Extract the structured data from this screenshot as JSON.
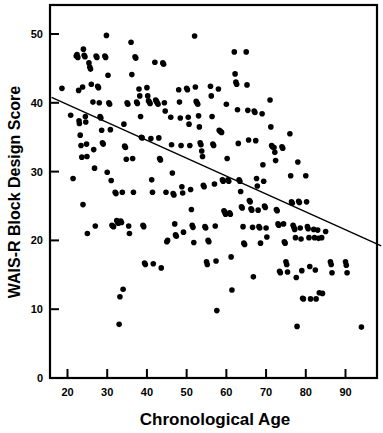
{
  "chart_data": {
    "type": "scatter",
    "title": "",
    "xlabel": "Chronological Age",
    "ylabel": "WAIS-R Block Design Score",
    "xlim": [
      16,
      99
    ],
    "ylim": [
      0,
      53
    ],
    "xticks": [
      20,
      30,
      40,
      50,
      60,
      70,
      80,
      90
    ],
    "yticks": [
      0,
      10,
      20,
      30,
      40,
      50
    ],
    "xtick_labels": [
      "20",
      "30",
      "40",
      "50",
      "60",
      "70",
      "80",
      "90"
    ],
    "ytick_labels": [
      "0",
      "10",
      "20",
      "30",
      "40",
      "50"
    ],
    "grid": false,
    "legend": null,
    "marker": {
      "shape": "circle",
      "color": "#000000",
      "size_px": 5.6
    },
    "trend_line": {
      "type": "linear-regression",
      "color": "#000000",
      "width_px": 1.4,
      "x_start": 16,
      "y_start": 40.8,
      "x_end": 99,
      "y_end": 19.2
    },
    "frame": {
      "top": true,
      "right": true,
      "bottom": true,
      "left": true,
      "color": "#000000"
    },
    "n_points": 284,
    "points": [
      [
        18.6,
        42.1
      ],
      [
        20.8,
        38.2
      ],
      [
        21.4,
        29.0
      ],
      [
        22.2,
        46.8
      ],
      [
        22.4,
        47.0
      ],
      [
        22.6,
        46.6
      ],
      [
        22.8,
        41.8
      ],
      [
        22.9,
        37.4
      ],
      [
        23.0,
        37.0
      ],
      [
        23.2,
        35.3
      ],
      [
        23.4,
        33.8
      ],
      [
        23.6,
        32.1
      ],
      [
        23.8,
        42.3
      ],
      [
        23.9,
        25.2
      ],
      [
        24.0,
        47.8
      ],
      [
        24.2,
        46.9
      ],
      [
        24.4,
        46.7
      ],
      [
        24.5,
        38.0
      ],
      [
        24.6,
        37.2
      ],
      [
        24.8,
        34.0
      ],
      [
        24.9,
        32.2
      ],
      [
        25.0,
        21.0
      ],
      [
        25.4,
        45.8
      ],
      [
        25.6,
        45.2
      ],
      [
        25.8,
        44.9
      ],
      [
        26.0,
        42.7
      ],
      [
        26.4,
        40.1
      ],
      [
        26.6,
        33.2
      ],
      [
        26.8,
        30.5
      ],
      [
        27.0,
        22.1
      ],
      [
        27.2,
        46.8
      ],
      [
        27.4,
        46.6
      ],
      [
        27.6,
        42.4
      ],
      [
        27.8,
        42.2
      ],
      [
        28.0,
        40.0
      ],
      [
        28.2,
        38.0
      ],
      [
        28.4,
        37.8
      ],
      [
        28.6,
        36.0
      ],
      [
        28.8,
        34.2
      ],
      [
        29.0,
        34.0
      ],
      [
        29.4,
        46.8
      ],
      [
        29.6,
        46.6
      ],
      [
        29.8,
        49.8
      ],
      [
        30.0,
        29.9
      ],
      [
        30.2,
        44.0
      ],
      [
        30.4,
        40.0
      ],
      [
        30.6,
        39.8
      ],
      [
        30.8,
        36.1
      ],
      [
        31.0,
        28.7
      ],
      [
        31.2,
        22.2
      ],
      [
        31.4,
        22.1
      ],
      [
        31.6,
        22.0
      ],
      [
        32.0,
        27.0
      ],
      [
        32.2,
        26.8
      ],
      [
        32.4,
        22.9
      ],
      [
        32.6,
        22.7
      ],
      [
        32.8,
        22.5
      ],
      [
        33.0,
        7.8
      ],
      [
        33.2,
        11.8
      ],
      [
        33.4,
        22.8
      ],
      [
        33.6,
        22.6
      ],
      [
        33.8,
        27.0
      ],
      [
        34.0,
        12.9
      ],
      [
        34.2,
        36.9
      ],
      [
        34.4,
        33.7
      ],
      [
        34.6,
        33.5
      ],
      [
        34.8,
        31.8
      ],
      [
        35.0,
        40.0
      ],
      [
        35.2,
        39.8
      ],
      [
        35.4,
        22.1
      ],
      [
        35.6,
        21.0
      ],
      [
        36.0,
        48.8
      ],
      [
        36.2,
        44.1
      ],
      [
        36.4,
        31.9
      ],
      [
        36.6,
        27.0
      ],
      [
        37.0,
        46.7
      ],
      [
        37.2,
        46.5
      ],
      [
        37.4,
        40.1
      ],
      [
        37.6,
        39.9
      ],
      [
        38.0,
        42.0
      ],
      [
        38.2,
        41.0
      ],
      [
        38.4,
        38.0
      ],
      [
        38.6,
        35.0
      ],
      [
        38.8,
        34.9
      ],
      [
        39.0,
        22.2
      ],
      [
        39.2,
        22.0
      ],
      [
        39.4,
        16.7
      ],
      [
        39.6,
        16.5
      ],
      [
        40.0,
        42.2
      ],
      [
        40.2,
        41.0
      ],
      [
        40.4,
        40.3
      ],
      [
        40.6,
        40.1
      ],
      [
        40.8,
        39.9
      ],
      [
        41.0,
        34.8
      ],
      [
        41.2,
        28.8
      ],
      [
        41.4,
        27.0
      ],
      [
        41.6,
        16.6
      ],
      [
        42.0,
        45.9
      ],
      [
        42.2,
        40.4
      ],
      [
        42.4,
        40.2
      ],
      [
        42.6,
        40.0
      ],
      [
        42.8,
        39.8
      ],
      [
        43.0,
        34.9
      ],
      [
        43.2,
        31.9
      ],
      [
        43.4,
        31.7
      ],
      [
        43.6,
        16.0
      ],
      [
        44.0,
        45.8
      ],
      [
        44.2,
        45.6
      ],
      [
        44.4,
        40.0
      ],
      [
        44.6,
        38.8
      ],
      [
        44.8,
        27.0
      ],
      [
        45.0,
        19.8
      ],
      [
        45.2,
        20.0
      ],
      [
        46.0,
        37.9
      ],
      [
        46.2,
        33.9
      ],
      [
        46.4,
        29.8
      ],
      [
        46.6,
        26.8
      ],
      [
        46.8,
        26.6
      ],
      [
        47.0,
        22.4
      ],
      [
        47.2,
        20.8
      ],
      [
        47.4,
        20.6
      ],
      [
        48.0,
        41.9
      ],
      [
        48.2,
        40.1
      ],
      [
        48.4,
        37.8
      ],
      [
        48.6,
        33.8
      ],
      [
        48.8,
        27.8
      ],
      [
        49.0,
        26.9
      ],
      [
        49.2,
        21.2
      ],
      [
        50.0,
        42.1
      ],
      [
        50.2,
        41.9
      ],
      [
        50.4,
        37.9
      ],
      [
        50.6,
        36.9
      ],
      [
        50.8,
        33.8
      ],
      [
        51.0,
        27.4
      ],
      [
        51.2,
        24.5
      ],
      [
        51.4,
        22.2
      ],
      [
        51.6,
        21.9
      ],
      [
        51.8,
        19.7
      ],
      [
        52.0,
        49.7
      ],
      [
        52.2,
        42.3
      ],
      [
        52.4,
        40.2
      ],
      [
        52.6,
        40.0
      ],
      [
        52.8,
        39.8
      ],
      [
        53.0,
        38.1
      ],
      [
        53.2,
        36.5
      ],
      [
        53.4,
        34.2
      ],
      [
        53.6,
        33.9
      ],
      [
        53.8,
        33.0
      ],
      [
        54.0,
        32.2
      ],
      [
        54.2,
        28.0
      ],
      [
        54.4,
        27.8
      ],
      [
        54.6,
        22.0
      ],
      [
        54.8,
        21.8
      ],
      [
        55.0,
        16.9
      ],
      [
        55.2,
        16.5
      ],
      [
        55.4,
        20.0
      ],
      [
        55.6,
        19.8
      ],
      [
        56.0,
        42.4
      ],
      [
        56.2,
        41.0
      ],
      [
        56.4,
        38.0
      ],
      [
        56.6,
        34.0
      ],
      [
        56.8,
        33.8
      ],
      [
        57.0,
        28.2
      ],
      [
        57.2,
        22.1
      ],
      [
        57.4,
        17.0
      ],
      [
        57.6,
        9.8
      ],
      [
        58.0,
        42.0
      ],
      [
        58.2,
        36.0
      ],
      [
        58.4,
        35.9
      ],
      [
        58.6,
        35.8
      ],
      [
        58.8,
        35.7
      ],
      [
        59.0,
        28.8
      ],
      [
        59.2,
        28.6
      ],
      [
        59.4,
        24.3
      ],
      [
        59.6,
        24.1
      ],
      [
        59.8,
        23.8
      ],
      [
        60.0,
        39.8
      ],
      [
        60.2,
        31.9
      ],
      [
        60.4,
        28.8
      ],
      [
        60.6,
        28.6
      ],
      [
        60.8,
        24.0
      ],
      [
        61.0,
        23.8
      ],
      [
        61.2,
        17.6
      ],
      [
        61.4,
        12.8
      ],
      [
        62.0,
        47.4
      ],
      [
        62.2,
        44.2
      ],
      [
        62.4,
        43.0
      ],
      [
        62.6,
        42.7
      ],
      [
        62.8,
        39.0
      ],
      [
        63.0,
        34.1
      ],
      [
        63.2,
        28.8
      ],
      [
        63.4,
        28.6
      ],
      [
        63.6,
        27.1
      ],
      [
        63.8,
        24.9
      ],
      [
        64.0,
        24.7
      ],
      [
        64.2,
        22.0
      ],
      [
        64.4,
        19.6
      ],
      [
        64.6,
        19.4
      ],
      [
        65.0,
        47.4
      ],
      [
        65.2,
        42.6
      ],
      [
        65.4,
        38.9
      ],
      [
        65.6,
        34.6
      ],
      [
        65.8,
        25.8
      ],
      [
        66.0,
        25.6
      ],
      [
        66.2,
        24.6
      ],
      [
        66.4,
        24.4
      ],
      [
        66.6,
        21.9
      ],
      [
        66.8,
        14.7
      ],
      [
        67.0,
        38.8
      ],
      [
        67.2,
        38.6
      ],
      [
        67.4,
        34.5
      ],
      [
        67.6,
        29.0
      ],
      [
        67.8,
        27.9
      ],
      [
        68.0,
        24.4
      ],
      [
        68.2,
        22.0
      ],
      [
        68.4,
        21.8
      ],
      [
        68.6,
        19.6
      ],
      [
        69.0,
        38.4
      ],
      [
        69.2,
        31.0
      ],
      [
        69.4,
        28.6
      ],
      [
        69.6,
        25.0
      ],
      [
        69.8,
        24.8
      ],
      [
        70.0,
        21.8
      ],
      [
        70.2,
        20.5
      ],
      [
        71.0,
        40.4
      ],
      [
        71.2,
        36.5
      ],
      [
        71.4,
        33.8
      ],
      [
        71.6,
        33.6
      ],
      [
        72.0,
        33.5
      ],
      [
        72.2,
        32.8
      ],
      [
        72.4,
        31.6
      ],
      [
        72.6,
        24.5
      ],
      [
        72.8,
        24.3
      ],
      [
        73.0,
        22.4
      ],
      [
        73.2,
        22.2
      ],
      [
        73.4,
        15.5
      ],
      [
        73.6,
        15.3
      ],
      [
        74.0,
        33.6
      ],
      [
        74.2,
        33.4
      ],
      [
        74.4,
        22.4
      ],
      [
        74.6,
        19.8
      ],
      [
        74.8,
        19.6
      ],
      [
        75.0,
        16.9
      ],
      [
        75.2,
        16.5
      ],
      [
        75.4,
        15.4
      ],
      [
        76.0,
        35.5
      ],
      [
        76.2,
        29.4
      ],
      [
        76.4,
        25.6
      ],
      [
        76.6,
        25.4
      ],
      [
        76.8,
        22.2
      ],
      [
        77.0,
        21.9
      ],
      [
        77.2,
        21.6
      ],
      [
        77.4,
        20.4
      ],
      [
        77.6,
        14.6
      ],
      [
        77.8,
        7.5
      ],
      [
        78.0,
        31.4
      ],
      [
        78.2,
        25.7
      ],
      [
        78.4,
        25.5
      ],
      [
        78.6,
        21.8
      ],
      [
        78.8,
        20.2
      ],
      [
        79.0,
        15.6
      ],
      [
        79.2,
        11.6
      ],
      [
        79.4,
        11.5
      ],
      [
        80.0,
        29.4
      ],
      [
        80.2,
        25.6
      ],
      [
        80.4,
        22.0
      ],
      [
        80.6,
        21.7
      ],
      [
        80.8,
        20.4
      ],
      [
        81.0,
        16.2
      ],
      [
        81.2,
        11.5
      ],
      [
        82.0,
        21.6
      ],
      [
        82.2,
        20.4
      ],
      [
        82.4,
        15.7
      ],
      [
        82.6,
        11.5
      ],
      [
        83.0,
        21.5
      ],
      [
        83.2,
        20.3
      ],
      [
        83.4,
        12.4
      ],
      [
        84.0,
        20.4
      ],
      [
        84.2,
        12.3
      ],
      [
        85.0,
        21.3
      ],
      [
        86.2,
        16.9
      ],
      [
        86.4,
        16.5
      ],
      [
        86.6,
        15.3
      ],
      [
        90.0,
        16.9
      ],
      [
        90.2,
        16.4
      ],
      [
        90.4,
        15.3
      ],
      [
        94.0,
        7.4
      ]
    ]
  }
}
